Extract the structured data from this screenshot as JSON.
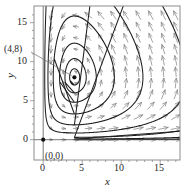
{
  "figure": {
    "type": "phase-portrait",
    "background_color": "#ffffff",
    "frame_color": "#8c8c8c",
    "orbit_color": "#1a1a1a",
    "arrow_color": "#7d7d7d",
    "axis_color": "#555555",
    "text_color": "#262626"
  },
  "axes": {
    "x_name": "x",
    "y_name": "y",
    "x_ticks": [
      "0",
      "5",
      "10",
      "15"
    ],
    "y_ticks": [
      "0",
      "5",
      "10",
      "15"
    ],
    "x_tick_values": [
      0,
      5,
      10,
      15
    ],
    "y_tick_values": [
      0,
      5,
      10,
      15
    ],
    "xlim": [
      -1.3,
      17.7
    ],
    "ylim": [
      -1.3,
      16.5
    ],
    "minor_tick_step": 1
  },
  "annotations": [
    {
      "name": "center-point-label",
      "text": "(4,8)",
      "point": [
        4,
        8
      ],
      "leader": true
    },
    {
      "name": "origin-point-label",
      "text": "(0,0)",
      "point": [
        0,
        0
      ],
      "leader": false
    }
  ],
  "equilibria": [
    {
      "name": "center",
      "x": 4,
      "y": 8,
      "marker": "filled-circle"
    },
    {
      "name": "saddle-origin",
      "x": 0,
      "y": 0,
      "marker": "filled-circle"
    }
  ],
  "chart_data": {
    "type": "line",
    "title": "",
    "xlabel": "x",
    "ylabel": "y",
    "xlim": [
      -1.3,
      17.7
    ],
    "ylim": [
      -1.3,
      16.5
    ],
    "grid": false,
    "legend": "none",
    "center": [
      4,
      8
    ],
    "saddle": [
      0,
      0
    ],
    "flow_direction": "clockwise",
    "orbits": [
      {
        "name": "orbit-1",
        "a": 0.9,
        "b": 0.85,
        "note": "innermost near-circular orbit"
      },
      {
        "name": "orbit-2",
        "a": 2.0,
        "b": 1.9
      },
      {
        "name": "orbit-3",
        "a": 3.4,
        "b": 3.1
      },
      {
        "name": "orbit-4",
        "a": 5.1,
        "b": 4.5
      },
      {
        "name": "orbit-5",
        "a": 7.2,
        "b": 6.0
      },
      {
        "name": "orbit-6",
        "a": 9.6,
        "b": 7.2
      },
      {
        "name": "orbit-7",
        "a": 12.6,
        "b": 7.9,
        "note": "outermost orbit, clipped at frame"
      }
    ],
    "arrow_grid": {
      "x_start": 1,
      "x_step": 1.6,
      "y_start": 0,
      "y_step": 1.45,
      "style": "open-head-arrow"
    }
  }
}
